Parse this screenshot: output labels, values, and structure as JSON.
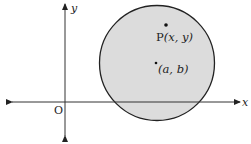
{
  "diagram": {
    "type": "coordinate-plane-circle",
    "axes": {
      "x_label": "x",
      "y_label": "y",
      "origin_label": "O"
    },
    "circle": {
      "fill": "#dcdcdc",
      "stroke": "#222222",
      "center_label": "(a, b)",
      "point_label_prefix": "P",
      "point_label_args": "(x, y)"
    },
    "colors": {
      "axis": "#333333",
      "text": "#222222",
      "background": "#ffffff"
    }
  }
}
